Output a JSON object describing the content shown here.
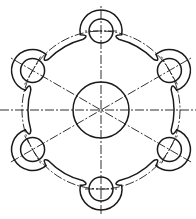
{
  "drawing": {
    "title": "Flange plate with six bolt lobes",
    "view": "front",
    "line_color": "#1a1a1a",
    "background": "#ffffff",
    "center": [
      101,
      110
    ],
    "central_bore_radius": 28,
    "bolt_circle_radius": 79,
    "bolt_hole_radius": 12,
    "lobe_radius": 21,
    "lobe_angles_deg": [
      -90,
      -30,
      30,
      90,
      150,
      210
    ],
    "lobe_count": 6
  }
}
